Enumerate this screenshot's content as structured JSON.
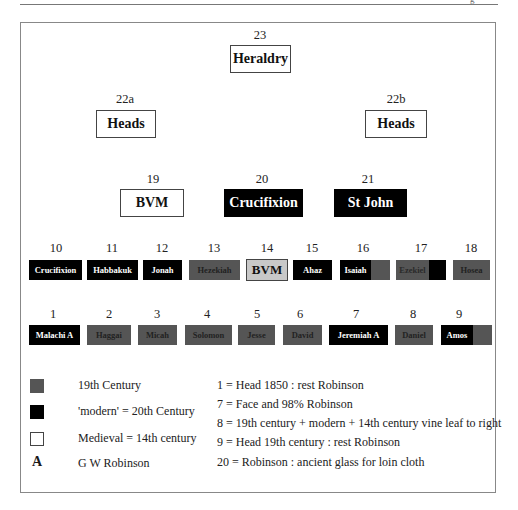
{
  "page": {
    "corner_fragment": "g"
  },
  "colors": {
    "c19": "#555555",
    "modern": "#000000",
    "medieval": "#ffffff",
    "bvm_grey": "#c8c8c8"
  },
  "top": {
    "p23": {
      "num": "23",
      "label": "Heraldry"
    },
    "p22a": {
      "num": "22a",
      "label": "Heads"
    },
    "p22b": {
      "num": "22b",
      "label": "Heads"
    }
  },
  "middle": {
    "p19": {
      "num": "19",
      "label": "BVM"
    },
    "p20": {
      "num": "20",
      "label": "Crucifixion"
    },
    "p21": {
      "num": "21",
      "label": "St John"
    }
  },
  "row_upper": [
    {
      "num": "10",
      "label": "Crucifixion",
      "type": "modern"
    },
    {
      "num": "11",
      "label": "Habbakuk",
      "type": "modern"
    },
    {
      "num": "12",
      "label": "Jonah",
      "type": "modern"
    },
    {
      "num": "13",
      "label": "Hezekiah",
      "type": "19th"
    },
    {
      "num": "14",
      "label": "BVM",
      "type": "medieval-grey"
    },
    {
      "num": "15",
      "label": "Ahaz",
      "type": "modern"
    },
    {
      "num": "16",
      "label": "Isaiah",
      "type": "modern+19th"
    },
    {
      "num": "17",
      "label": "Ezekiel",
      "type": "19th+modern"
    },
    {
      "num": "18",
      "label": "Hosea",
      "type": "19th"
    }
  ],
  "row_lower": [
    {
      "num": "1",
      "label": "Malachi A",
      "type": "modern"
    },
    {
      "num": "2",
      "label": "Haggai",
      "type": "19th"
    },
    {
      "num": "3",
      "label": "Micah",
      "type": "19th"
    },
    {
      "num": "4",
      "label": "Solomon",
      "type": "19th"
    },
    {
      "num": "5",
      "label": "Jesse",
      "type": "19th"
    },
    {
      "num": "6",
      "label": "David",
      "type": "19th"
    },
    {
      "num": "7",
      "label": "Jeremiah A",
      "type": "modern"
    },
    {
      "num": "8",
      "label": "Daniel",
      "type": "19th"
    },
    {
      "num": "9",
      "label": "Amos",
      "type": "modern+19th"
    }
  ],
  "legend": {
    "items": [
      {
        "swatch": "19th",
        "label": "19th Century"
      },
      {
        "swatch": "modern",
        "label": "'modern' = 20th Century"
      },
      {
        "swatch": "medieval",
        "label": "Medieval = 14th century"
      },
      {
        "swatch": "A",
        "symbol": "A",
        "label": "G W Robinson"
      }
    ],
    "notes": [
      "1 = Head 1850 : rest Robinson",
      "7 = Face and 98% Robinson",
      "8 = 19th century + modern + 14th century vine leaf to right",
      "9 = Head 19th century : rest Robinson",
      "20 = Robinson : ancient glass for loin cloth"
    ]
  }
}
